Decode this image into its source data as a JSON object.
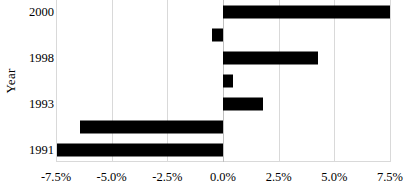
{
  "chart_data": {
    "type": "bar",
    "orientation": "horizontal",
    "title": "",
    "xlabel": "",
    "ylabel": "Year",
    "categories": [
      "2000",
      "",
      "1998",
      "",
      "1993",
      "",
      "1991"
    ],
    "values": [
      7.5,
      -0.5,
      4.25,
      0.45,
      1.8,
      -6.4,
      -7.45
    ],
    "value_format": "percent",
    "xlim": [
      -7.5,
      7.5
    ],
    "xticks": [
      -7.5,
      -5.0,
      -2.5,
      0.0,
      2.5,
      5.0,
      7.5
    ],
    "xticklabels": [
      "-7.5%",
      "-5.0%",
      "-2.5%",
      "0.0%",
      "2.5%",
      "5.0%",
      "7.5%"
    ],
    "yticklabels": [
      "2000",
      "",
      "1998",
      "",
      "1993",
      "",
      "1991"
    ],
    "grid": true,
    "legend": false,
    "bar_color": "#000000",
    "gridline_color": "#d9d9d9",
    "background_color": "#ffffff"
  },
  "axis": {
    "y_title": "Year",
    "y_ticks": [
      {
        "label": "2000"
      },
      {
        "label": ""
      },
      {
        "label": "1998"
      },
      {
        "label": ""
      },
      {
        "label": "1993"
      },
      {
        "label": ""
      },
      {
        "label": "1991"
      }
    ],
    "x_ticks": [
      {
        "label": "-7.5%",
        "value": -7.5
      },
      {
        "label": "-5.0%",
        "value": -5.0
      },
      {
        "label": "-2.5%",
        "value": -2.5
      },
      {
        "label": "0.0%",
        "value": 0.0
      },
      {
        "label": "2.5%",
        "value": 2.5
      },
      {
        "label": "5.0%",
        "value": 5.0
      },
      {
        "label": "7.5%",
        "value": 7.5
      }
    ]
  },
  "bars": [
    {
      "category": "2000",
      "value": 7.5
    },
    {
      "category": "",
      "value": -0.5
    },
    {
      "category": "1998",
      "value": 4.25
    },
    {
      "category": "",
      "value": 0.45
    },
    {
      "category": "1993",
      "value": 1.8
    },
    {
      "category": "",
      "value": -6.4
    },
    {
      "category": "1991",
      "value": -7.45
    }
  ]
}
